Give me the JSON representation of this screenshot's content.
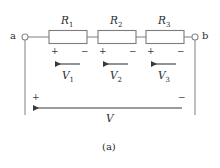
{
  "figure": {
    "caption": "(a)",
    "terminals": [
      {
        "label": "a",
        "side": "left"
      },
      {
        "label": "b",
        "side": "right"
      }
    ],
    "wire_color": "#8a8a8a",
    "box_border_color": "#7d7d7d",
    "box_fill_color": "#ffffff",
    "arrow_color": "#3a3a3a",
    "text_color": "#2b2b2b",
    "resistors": [
      {
        "name": "R",
        "subscript": "1",
        "plus": "+",
        "minus": "−",
        "voltage_name": "V",
        "voltage_subscript": "1",
        "arrow_direction": "left"
      },
      {
        "name": "R",
        "subscript": "2",
        "plus": "+",
        "minus": "−",
        "voltage_name": "V",
        "voltage_subscript": "2",
        "arrow_direction": "left"
      },
      {
        "name": "R",
        "subscript": "3",
        "plus": "+",
        "minus": "−",
        "voltage_name": "V",
        "voltage_subscript": "3",
        "arrow_direction": "left"
      }
    ],
    "source": {
      "plus": "+",
      "minus": "−",
      "voltage_name": "V",
      "arrow_direction": "left"
    }
  }
}
